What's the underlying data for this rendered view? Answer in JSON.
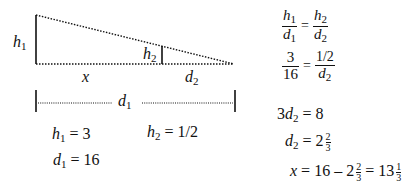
{
  "diagram": {
    "labels": {
      "h1": {
        "var": "h",
        "sub": "1"
      },
      "h2": {
        "var": "h",
        "sub": "2"
      },
      "x": "x",
      "d2": {
        "var": "d",
        "sub": "2"
      },
      "d1": {
        "var": "d",
        "sub": "1"
      }
    }
  },
  "givens": {
    "h1": {
      "var": "h",
      "sub": "1",
      "value": "= 3"
    },
    "h2": {
      "var": "h",
      "sub": "2",
      "value": "= 1/2"
    },
    "d1": {
      "var": "d",
      "sub": "1",
      "value": "= 16"
    }
  },
  "solution": {
    "step1": {
      "lhs_num": "h",
      "lhs_num_sub": "1",
      "lhs_den": "d",
      "lhs_den_sub": "1",
      "eq": "=",
      "rhs_num": "h",
      "rhs_num_sub": "2",
      "rhs_den": "d",
      "rhs_den_sub": "2"
    },
    "step2": {
      "lhs_num": "3",
      "lhs_den": "16",
      "eq": "=",
      "rhs_num": "1/2",
      "rhs_den": "d",
      "rhs_den_sub": "2"
    },
    "step3": {
      "coef": "3",
      "var": "d",
      "sub": "2",
      "rest": "= 8"
    },
    "step4": {
      "var": "d",
      "sub": "2",
      "rest": "= 2",
      "frac_num": "2",
      "frac_den": "3"
    },
    "step5": {
      "var": "x",
      "rest1": "= 16 – 2",
      "f1_num": "2",
      "f1_den": "3",
      "rest2": "= 13",
      "f2_num": "1",
      "f2_den": "3"
    }
  }
}
